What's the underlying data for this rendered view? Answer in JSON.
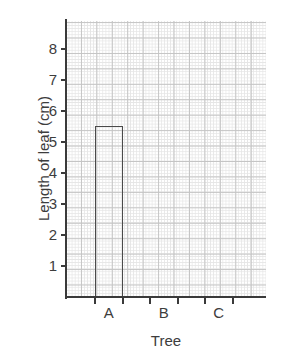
{
  "chart_data": {
    "type": "bar",
    "title": "",
    "xlabel": "Tree",
    "ylabel": "Length of leaf (cm)",
    "categories": [
      "A",
      "B",
      "C"
    ],
    "values": [
      5.5,
      null,
      null
    ],
    "series": [
      {
        "name": "Length of leaf",
        "values": [
          5.5,
          null,
          null
        ]
      }
    ],
    "ylim": [
      0,
      8.9
    ],
    "xlim": [
      0,
      3.25
    ],
    "y_ticks": [
      1,
      2,
      3,
      4,
      5,
      6,
      7,
      8
    ],
    "y_tick_labels": [
      "1",
      "2",
      "3",
      "4",
      "5",
      "6",
      "7",
      "8"
    ],
    "grid": "both",
    "grid_minor_color": "#e6e6e6",
    "grid_major_color": "#c4c4c4",
    "axis_color": "#3a3a3a",
    "bar_edge_color": "#4a4a4a",
    "bar_fill_color": "#ffffff",
    "legend": "none"
  },
  "axes": {
    "y_title": "Length of leaf (cm)",
    "x_title": "Tree",
    "y_tick_labels": [
      {
        "value": 8,
        "label": "8"
      },
      {
        "value": 7,
        "label": "7"
      },
      {
        "value": 6,
        "label": "6"
      },
      {
        "value": 5,
        "label": "5"
      },
      {
        "value": 4,
        "label": "4"
      },
      {
        "value": 3,
        "label": "3"
      },
      {
        "value": 2,
        "label": "2"
      },
      {
        "value": 1,
        "label": "1"
      }
    ],
    "x_tick_labels": [
      {
        "label": "A"
      },
      {
        "label": "B"
      },
      {
        "label": "C"
      }
    ]
  }
}
